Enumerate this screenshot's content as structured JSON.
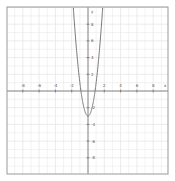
{
  "chart_data": {
    "type": "line",
    "title": "",
    "xlabel": "x",
    "ylabel": "y",
    "xlim": [
      -10,
      10
    ],
    "ylim": [
      -10,
      10
    ],
    "grid": true,
    "grid_minor_step": 1,
    "x_ticks": [
      -8,
      -6,
      -4,
      -2,
      2,
      4,
      6,
      8
    ],
    "y_ticks": [
      8,
      6,
      4,
      2,
      -2,
      -4,
      -6,
      -8
    ],
    "series": [
      {
        "name": "parabola",
        "equation": "y = 4x^2 - 3",
        "a": 4,
        "c": -3,
        "color": "#777777",
        "x": [
          -1.8,
          -1.5,
          -1.0,
          -0.5,
          0,
          0.5,
          1.0,
          1.5,
          1.8
        ],
        "y": [
          9.96,
          6,
          1,
          -2,
          -3,
          -2,
          1,
          6,
          9.96
        ]
      }
    ]
  },
  "style": {
    "grid_color": "#e6e6e6",
    "axis_color": "#888888",
    "border_color": "#999999",
    "curve_color": "#777777"
  }
}
